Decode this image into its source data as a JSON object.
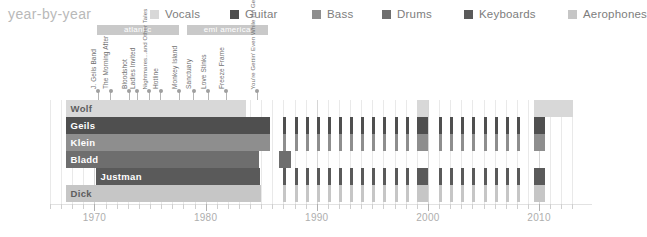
{
  "header": {
    "title": "year-by-year",
    "title_color": "#b9b9b9"
  },
  "legend": {
    "items": [
      {
        "label": "Vocals",
        "color": "#d8d8d8",
        "x": 0
      },
      {
        "label": "Guitar",
        "color": "#4f4f4f",
        "x": 80
      },
      {
        "label": "Bass",
        "color": "#8e8e8e",
        "x": 162
      },
      {
        "label": "Drums",
        "color": "#6e6e6e",
        "x": 232
      },
      {
        "label": "Keyboards",
        "color": "#5a5a5a",
        "x": 314
      },
      {
        "label": "Aerophones",
        "color": "#c6c6c6",
        "x": 418
      }
    ]
  },
  "record_labels": [
    {
      "name": "atlantic",
      "start_year": 1970.2,
      "end_year": 1977.6,
      "color": "#c9c9c9"
    },
    {
      "name": "emi america",
      "start_year": 1978.3,
      "end_year": 1985.6,
      "color": "#c9c9c9"
    }
  ],
  "albums": [
    {
      "title": "J. Geils Band",
      "year": 1970.3,
      "lines": 1
    },
    {
      "title": "The Morning After",
      "year": 1971.4,
      "lines": 1
    },
    {
      "title": "Bloodshot",
      "year": 1973.1,
      "lines": 1
    },
    {
      "title": "Ladies Invited",
      "year": 1973.8,
      "lines": 1
    },
    {
      "title": "Nightmares...and Other Tales",
      "year": 1974.9,
      "lines": 2
    },
    {
      "title": "Hotline",
      "year": 1975.9,
      "lines": 1
    },
    {
      "title": "Monkey Island",
      "year": 1977.6,
      "lines": 1
    },
    {
      "title": "Sanctuary",
      "year": 1978.9,
      "lines": 1
    },
    {
      "title": "Love Stinks",
      "year": 1980.2,
      "lines": 1
    },
    {
      "title": "Freeze Frame",
      "year": 1981.8,
      "lines": 1
    },
    {
      "title": "You're Gettin' Even While I'm Gettin' Odd",
      "year": 1984.6,
      "lines": 2
    }
  ],
  "members": [
    {
      "name": "Wolf",
      "role": "Vocals",
      "color": "#d8d8d8",
      "label_color": "#5d5d5d",
      "continuous": {
        "start": 1967.4,
        "end": 1983.6
      },
      "tour_years": [
        1999.0,
        2009.5,
        2010.0,
        2011.0,
        2012.0
      ],
      "stripes": []
    },
    {
      "name": "Geils",
      "role": "Guitar",
      "color": "#4f4f4f",
      "label_color": "#ffffff",
      "continuous": {
        "start": 1967.4,
        "end": 1985.8
      },
      "tour_years": [
        1999.0,
        2009.5
      ],
      "stripes": [
        1987,
        1988,
        1989,
        1990,
        1991,
        1992,
        1993,
        1994,
        1995,
        1996,
        1997,
        1998,
        2001,
        2002,
        2003,
        2004,
        2005,
        2006,
        2007,
        2008
      ]
    },
    {
      "name": "Klein",
      "role": "Bass",
      "color": "#8e8e8e",
      "label_color": "#ffffff",
      "continuous": {
        "start": 1967.4,
        "end": 1985.8
      },
      "tour_years": [
        1999.0,
        2009.5
      ],
      "stripes": [
        1987,
        1988,
        1989,
        1990,
        1991,
        1992,
        1993,
        1994,
        1995,
        1996,
        1997,
        1998,
        2001,
        2002,
        2003,
        2004,
        2005,
        2006,
        2007,
        2008
      ]
    },
    {
      "name": "Bladd",
      "role": "Drums",
      "color": "#6e6e6e",
      "label_color": "#ffffff",
      "continuous": {
        "start": 1967.4,
        "end": 1984.8
      },
      "tour_years": [
        1986.6
      ],
      "stripes": []
    },
    {
      "name": "Justman",
      "role": "Keyboards",
      "color": "#5a5a5a",
      "label_color": "#ffffff",
      "continuous": {
        "start": 1970.1,
        "end": 1984.9
      },
      "tour_years": [
        1999.0,
        2009.5
      ],
      "stripes": [
        1987,
        1988,
        1989,
        1990,
        1991,
        1992,
        1993,
        1994,
        1995,
        1996,
        1997,
        1998,
        2001,
        2002,
        2003,
        2004,
        2005,
        2006,
        2007,
        2008
      ]
    },
    {
      "name": "Dick",
      "role": "Aerophones",
      "color": "#c6c6c6",
      "label_color": "#5d5d5d",
      "continuous": {
        "start": 1967.4,
        "end": 1985.0
      },
      "tour_years": [
        1999.0,
        2009.5
      ],
      "stripes": [
        1987,
        1988,
        1989,
        1990,
        1991,
        1992,
        1993,
        1994,
        1995,
        1996,
        1997,
        1998,
        2001,
        2002,
        2003,
        2004,
        2005,
        2006,
        2007,
        2008
      ]
    }
  ],
  "axis": {
    "min_year": 1966.0,
    "max_year": 2013.5,
    "major_ticks": [
      1970,
      1980,
      1990,
      2000,
      2010
    ],
    "minor_step": 1,
    "tick_label_color": "#aeaeae"
  },
  "chart_data": {
    "type": "bar",
    "title": "year-by-year",
    "xlabel": "",
    "ylabel": "",
    "xlim": [
      1966.0,
      2013.5
    ],
    "grid": true,
    "legend_position": "top-right",
    "categories": [
      "Wolf",
      "Geils",
      "Klein",
      "Bladd",
      "Justman",
      "Dick"
    ],
    "series": [
      {
        "name": "Wolf",
        "instrument": "Vocals",
        "active_from": 1967,
        "active_to": 1983
      },
      {
        "name": "Geils",
        "instrument": "Guitar",
        "active_from": 1967,
        "active_to": 1985
      },
      {
        "name": "Klein",
        "instrument": "Bass",
        "active_from": 1967,
        "active_to": 1985
      },
      {
        "name": "Bladd",
        "instrument": "Drums",
        "active_from": 1967,
        "active_to": 1984
      },
      {
        "name": "Justman",
        "instrument": "Keyboards",
        "active_from": 1970,
        "active_to": 1984
      },
      {
        "name": "Dick",
        "instrument": "Aerophones",
        "active_from": 1967,
        "active_to": 1985
      }
    ]
  }
}
